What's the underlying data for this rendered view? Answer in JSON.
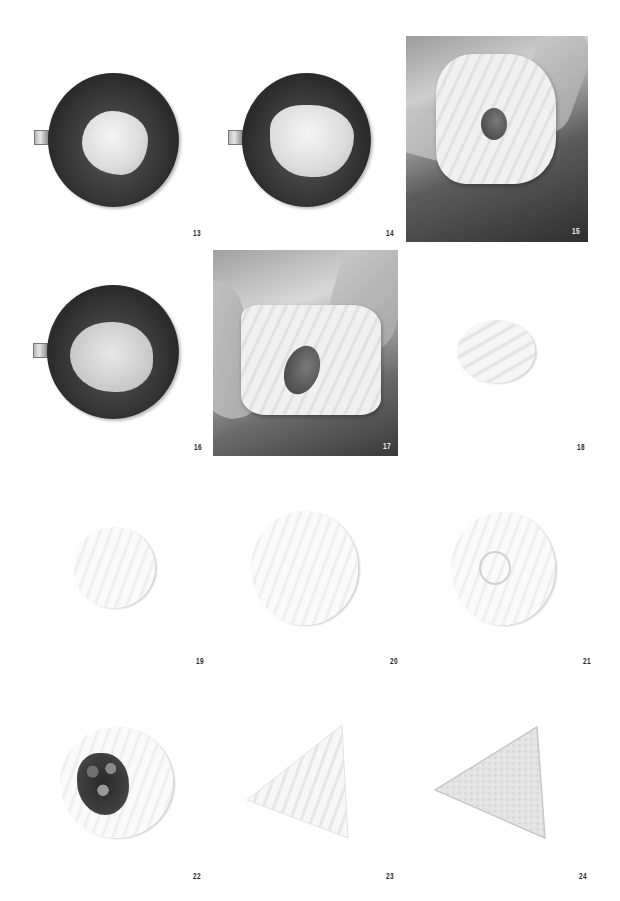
{
  "page": {
    "background": "#ffffff"
  },
  "steps": [
    {
      "number": "13",
      "subject": "dough in steel bowl"
    },
    {
      "number": "14",
      "subject": "dough in steel bowl, more developed"
    },
    {
      "number": "15",
      "subject": "hands stretching dough windowpane test with hole"
    },
    {
      "number": "16",
      "subject": "smooth dough in steel bowl"
    },
    {
      "number": "17",
      "subject": "hands stretching dough windowpane test with hole"
    },
    {
      "number": "18",
      "subject": "small round dough ball"
    },
    {
      "number": "19",
      "subject": "flattened dough disc"
    },
    {
      "number": "20",
      "subject": "rolled-out larger dough disc"
    },
    {
      "number": "21",
      "subject": "rolled dough disc with indented center"
    },
    {
      "number": "22",
      "subject": "dough disc topped with filling"
    },
    {
      "number": "23",
      "subject": "dough folded into triangle"
    },
    {
      "number": "24",
      "subject": "triangle pastry dusted with flour"
    }
  ],
  "colors": {
    "label": "#2a2a2a",
    "label_inverse": "#f2f2f2",
    "bowl_dark": "#2a2a2a",
    "dough_light": "#f0f0f0"
  }
}
